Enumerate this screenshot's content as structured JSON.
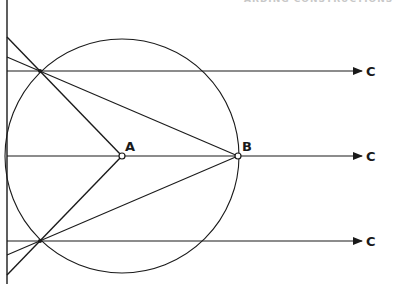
{
  "header": {
    "partial_text": "ARDING CONSTRUCTIONS"
  },
  "diagram": {
    "colors": {
      "stroke": "#1a1a1a",
      "background": "#ffffff"
    },
    "circle": {
      "cx": 122,
      "cy": 156,
      "r": 117
    },
    "points": {
      "A": {
        "label": "A",
        "x": 122,
        "y": 156
      },
      "B": {
        "label": "B",
        "x": 238,
        "y": 156
      },
      "P_top": {
        "x": 40,
        "y": 71
      },
      "P_bottom": {
        "x": 40,
        "y": 241
      }
    },
    "rays": [
      {
        "label": "C",
        "y": 71
      },
      {
        "label": "C",
        "y": 156
      },
      {
        "label": "C",
        "y": 241
      }
    ],
    "left_line": {
      "x": 7,
      "y1": 0,
      "y2": 284
    }
  }
}
